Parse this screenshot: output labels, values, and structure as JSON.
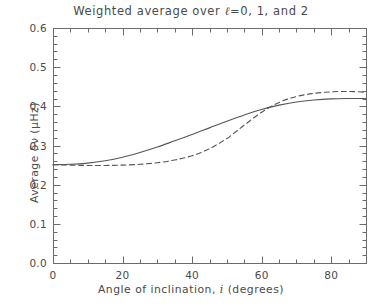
{
  "chart_data": {
    "type": "line",
    "title": "Weighted average over ℓ=0, 1, and 2",
    "title_prefix": "Weighted average over ",
    "title_ell": "ℓ",
    "title_suffix": "=0, 1, and 2",
    "xlabel": "Angle of inclination, i (degrees)",
    "xlabel_prefix": "Angle of inclination, ",
    "xlabel_var": "i",
    "xlabel_suffix": " (degrees)",
    "ylabel": "Average δν (μHz)",
    "xlim": [
      0,
      90
    ],
    "ylim": [
      0.0,
      0.6
    ],
    "xticks": [
      0,
      20,
      40,
      60,
      80
    ],
    "xtick_labels": [
      "0",
      "20",
      "40",
      "60",
      "80"
    ],
    "yticks": [
      0.0,
      0.1,
      0.2,
      0.3,
      0.4,
      0.5,
      0.6
    ],
    "ytick_labels": [
      "0.0",
      "0.1",
      "0.2",
      "0.3",
      "0.4",
      "0.5",
      "0.6"
    ],
    "x_minor_interval": 5,
    "y_minor_interval": 0.02,
    "grid": false,
    "legend": "none",
    "line_color": "#555555",
    "axis_color": "#6a6a6a",
    "background": "#ffffff",
    "x": [
      0,
      5,
      10,
      15,
      20,
      25,
      30,
      35,
      40,
      45,
      50,
      55,
      60,
      65,
      70,
      75,
      80,
      85,
      90
    ],
    "series": [
      {
        "name": "solid",
        "style": "solid",
        "values": [
          0.251,
          0.252,
          0.255,
          0.261,
          0.27,
          0.282,
          0.296,
          0.312,
          0.328,
          0.345,
          0.362,
          0.378,
          0.392,
          0.403,
          0.411,
          0.416,
          0.419,
          0.42,
          0.42
        ]
      },
      {
        "name": "dashed",
        "style": "dashed",
        "values": [
          0.251,
          0.25,
          0.249,
          0.249,
          0.25,
          0.252,
          0.256,
          0.263,
          0.274,
          0.292,
          0.318,
          0.352,
          0.385,
          0.41,
          0.425,
          0.433,
          0.437,
          0.438,
          0.436
        ]
      }
    ]
  },
  "plot_geometry": {
    "left": 53,
    "right": 366,
    "top": 28,
    "bottom": 263
  }
}
